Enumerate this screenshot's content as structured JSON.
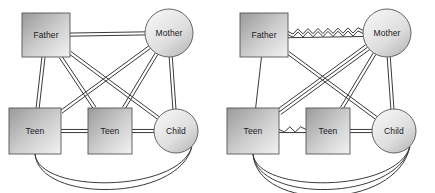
{
  "figure": {
    "type": "diagram",
    "kind": "family-systems-sociogram-pair",
    "background_color": "#ffffff",
    "line_color": "#3a3a3a",
    "node_stroke_color": "#555555",
    "label_color": "#1a1a1a",
    "box_gradient": {
      "from": "#9a9a9a",
      "to": "#f2f2f2"
    },
    "circle_gradient": {
      "from": "#f4f4f4",
      "to": "#bcbcbc"
    }
  },
  "panels": [
    {
      "id": "left",
      "name": "left-diagram",
      "nodes": [
        {
          "id": "father",
          "label": "Father",
          "shape": "square",
          "x": 46,
          "y": 35,
          "w": 48,
          "h": 44
        },
        {
          "id": "mother",
          "label": "Mother",
          "shape": "circle",
          "x": 169,
          "y": 33,
          "r": 24
        },
        {
          "id": "teen1",
          "label": "Teen",
          "shape": "square",
          "x": 35,
          "y": 131,
          "w": 52,
          "h": 46
        },
        {
          "id": "teen2",
          "label": "Teen",
          "shape": "square",
          "x": 110,
          "y": 131,
          "w": 44,
          "h": 46
        },
        {
          "id": "child",
          "label": "Child",
          "shape": "circle",
          "x": 176,
          "y": 131,
          "r": 22
        }
      ],
      "edges": [
        {
          "from": "father",
          "to": "mother",
          "count": 2,
          "style": "straight",
          "kind": "horizontal"
        },
        {
          "from": "father",
          "to": "teen1",
          "count": 2,
          "style": "straight",
          "kind": "vertical"
        },
        {
          "from": "father",
          "to": "teen2",
          "count": 2,
          "style": "straight",
          "kind": "diagonal"
        },
        {
          "from": "father",
          "to": "child",
          "count": 2,
          "style": "straight",
          "kind": "diagonal"
        },
        {
          "from": "mother",
          "to": "teen1",
          "count": 2,
          "style": "straight",
          "kind": "diagonal"
        },
        {
          "from": "mother",
          "to": "teen2",
          "count": 2,
          "style": "straight",
          "kind": "diagonal"
        },
        {
          "from": "mother",
          "to": "child",
          "count": 2,
          "style": "straight",
          "kind": "vertical"
        },
        {
          "from": "teen1",
          "to": "teen2",
          "count": 2,
          "style": "straight",
          "kind": "horizontal"
        },
        {
          "from": "teen2",
          "to": "child",
          "count": 2,
          "style": "straight",
          "kind": "horizontal"
        },
        {
          "from": "teen1",
          "to": "child",
          "count": 2,
          "style": "arc",
          "kind": "bottom-arc"
        }
      ]
    },
    {
      "id": "right",
      "name": "right-diagram",
      "nodes": [
        {
          "id": "father",
          "label": "Father",
          "shape": "square",
          "x": 46,
          "y": 35,
          "w": 48,
          "h": 44
        },
        {
          "id": "mother",
          "label": "Mother",
          "shape": "circle",
          "x": 169,
          "y": 33,
          "r": 24
        },
        {
          "id": "teen1",
          "label": "Teen",
          "shape": "square",
          "x": 35,
          "y": 131,
          "w": 52,
          "h": 46
        },
        {
          "id": "teen2",
          "label": "Teen",
          "shape": "square",
          "x": 110,
          "y": 131,
          "w": 44,
          "h": 46
        },
        {
          "id": "child",
          "label": "Child",
          "shape": "circle",
          "x": 176,
          "y": 131,
          "r": 22
        }
      ],
      "edges": [
        {
          "from": "father",
          "to": "mother",
          "count": 2,
          "style": "zigzag",
          "kind": "horizontal"
        },
        {
          "from": "father",
          "to": "mother",
          "count": 1,
          "style": "straight",
          "kind": "horizontal"
        },
        {
          "from": "father",
          "to": "teen1",
          "count": 1,
          "style": "straight",
          "kind": "vertical"
        },
        {
          "from": "father",
          "to": "child",
          "count": 2,
          "style": "straight",
          "kind": "diagonal"
        },
        {
          "from": "mother",
          "to": "teen1",
          "count": 3,
          "style": "straight",
          "kind": "diagonal"
        },
        {
          "from": "mother",
          "to": "teen2",
          "count": 2,
          "style": "straight",
          "kind": "diagonal"
        },
        {
          "from": "mother",
          "to": "child",
          "count": 2,
          "style": "straight",
          "kind": "vertical"
        },
        {
          "from": "teen1",
          "to": "teen2",
          "count": 1,
          "style": "zigzag",
          "kind": "horizontal"
        },
        {
          "from": "teen1",
          "to": "teen2",
          "count": 1,
          "style": "straight",
          "kind": "horizontal"
        },
        {
          "from": "teen2",
          "to": "child",
          "count": 2,
          "style": "straight",
          "kind": "horizontal"
        },
        {
          "from": "teen1",
          "to": "child",
          "count": 3,
          "style": "arc",
          "kind": "bottom-arc"
        }
      ]
    }
  ],
  "legend_notes": {
    "straight_line": "relationship / bond",
    "double_line": "close relationship",
    "zigzag_line": "conflictual relationship"
  }
}
